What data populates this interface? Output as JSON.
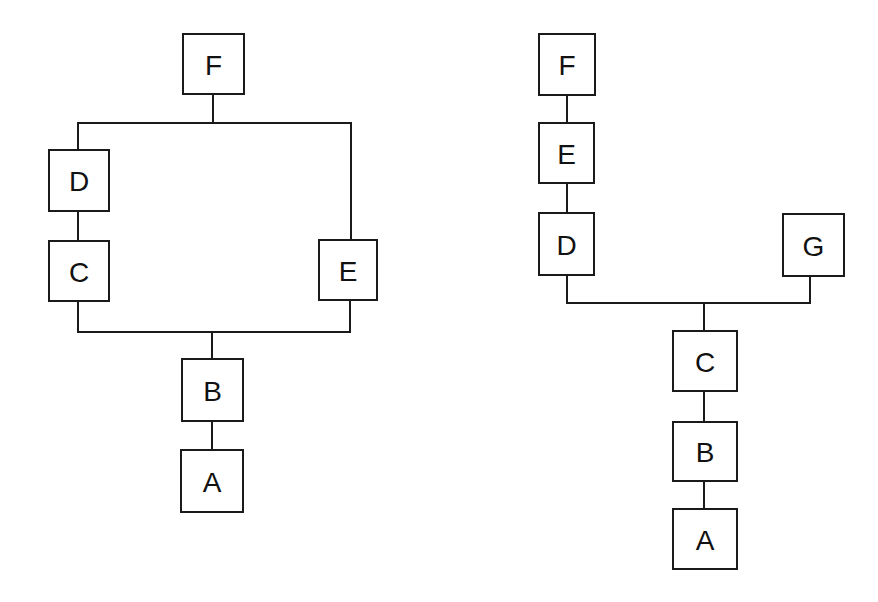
{
  "diagrams": [
    {
      "name": "left-tree",
      "nodes": [
        {
          "id": "F",
          "label": "F",
          "x": 183,
          "y": 34,
          "w": 61,
          "h": 60
        },
        {
          "id": "D",
          "label": "D",
          "x": 49,
          "y": 150,
          "w": 60,
          "h": 61
        },
        {
          "id": "C",
          "label": "C",
          "x": 49,
          "y": 241,
          "w": 60,
          "h": 60
        },
        {
          "id": "E",
          "label": "E",
          "x": 319,
          "y": 240,
          "w": 58,
          "h": 60
        },
        {
          "id": "B",
          "label": "B",
          "x": 182,
          "y": 359,
          "w": 61,
          "h": 62
        },
        {
          "id": "A",
          "label": "A",
          "x": 181,
          "y": 450,
          "w": 62,
          "h": 62
        }
      ],
      "lines": [
        {
          "points": [
            [
              213,
              94
            ],
            [
              213,
              123
            ]
          ]
        },
        {
          "points": [
            [
              78,
              150
            ],
            [
              78,
              123
            ],
            [
              351,
              123
            ],
            [
              351,
              240
            ]
          ]
        },
        {
          "points": [
            [
              78,
              211
            ],
            [
              78,
              241
            ]
          ]
        },
        {
          "points": [
            [
              78,
              301
            ],
            [
              78,
              332
            ],
            [
              350,
              332
            ],
            [
              350,
              300
            ]
          ]
        },
        {
          "points": [
            [
              212,
              332
            ],
            [
              212,
              359
            ]
          ]
        },
        {
          "points": [
            [
              212,
              421
            ],
            [
              212,
              450
            ]
          ]
        }
      ]
    },
    {
      "name": "right-tree",
      "nodes": [
        {
          "id": "F",
          "label": "F",
          "x": 539,
          "y": 34,
          "w": 56,
          "h": 61
        },
        {
          "id": "E",
          "label": "E",
          "x": 539,
          "y": 123,
          "w": 55,
          "h": 60
        },
        {
          "id": "D",
          "label": "D",
          "x": 539,
          "y": 213,
          "w": 55,
          "h": 62
        },
        {
          "id": "G",
          "label": "G",
          "x": 783,
          "y": 214,
          "w": 61,
          "h": 62
        },
        {
          "id": "C",
          "label": "C",
          "x": 673,
          "y": 331,
          "w": 64,
          "h": 60
        },
        {
          "id": "B",
          "label": "B",
          "x": 673,
          "y": 422,
          "w": 64,
          "h": 59
        },
        {
          "id": "A",
          "label": "A",
          "x": 673,
          "y": 509,
          "w": 64,
          "h": 60
        }
      ],
      "lines": [
        {
          "points": [
            [
              567,
              95
            ],
            [
              567,
              123
            ]
          ]
        },
        {
          "points": [
            [
              567,
              183
            ],
            [
              567,
              213
            ]
          ]
        },
        {
          "points": [
            [
              567,
              275
            ],
            [
              567,
              303
            ],
            [
              810,
              303
            ],
            [
              810,
              276
            ]
          ]
        },
        {
          "points": [
            [
              704,
              303
            ],
            [
              704,
              331
            ]
          ]
        },
        {
          "points": [
            [
              704,
              391
            ],
            [
              704,
              422
            ]
          ]
        },
        {
          "points": [
            [
              704,
              481
            ],
            [
              704,
              509
            ]
          ]
        }
      ]
    }
  ]
}
